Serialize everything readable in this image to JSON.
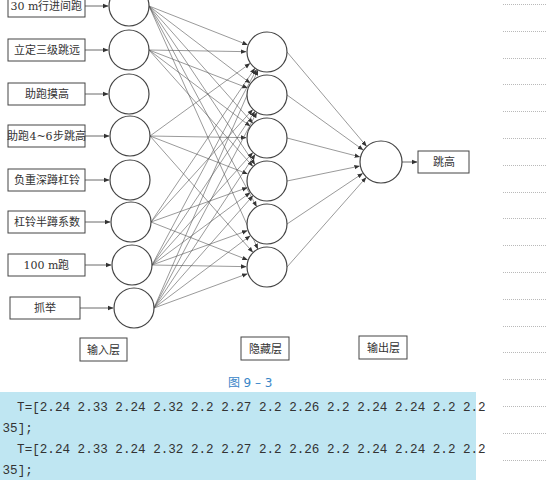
{
  "figure": {
    "caption": "图 9 – 3",
    "inputs": [
      {
        "label": "30 m行进间跑"
      },
      {
        "label": "立定三级跳远"
      },
      {
        "label": "助跑摸高"
      },
      {
        "label": "助跑4~6步跳高"
      },
      {
        "label": "负重深蹲杠铃"
      },
      {
        "label": "杠铃半蹲系数"
      },
      {
        "label": "100 m跑"
      },
      {
        "label": "抓举"
      }
    ],
    "hidden_node_count": 6,
    "output": {
      "label": "跳高"
    },
    "layer_labels": {
      "input": "输入层",
      "hidden": "隐藏层",
      "output": "输出层"
    }
  },
  "code": {
    "lines": [
      "  T=[2.24 2.33 2.24 2.32 2.2 2.27 2.2 2.26 2.2 2.24 2.24 2.2 2.2",
      ".35];",
      "  T=[2.24 2.33 2.24 2.32 2.2 2.27 2.2 2.26 2.2 2.24 2.24 2.2 2.2",
      ".35];"
    ]
  },
  "colors": {
    "code_background": "#bfe6f2",
    "caption": "#3a86c8",
    "stroke": "#444444"
  }
}
